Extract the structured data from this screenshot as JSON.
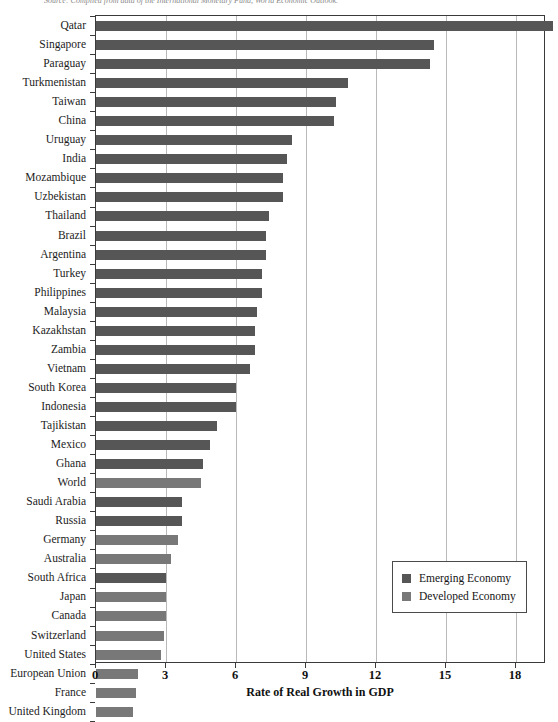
{
  "source_note": "Source: Compiled from data of the International Monetary Fund, World Economic Outlook.",
  "legend": {
    "items": [
      {
        "label": "Emerging Economy",
        "color": "#565656",
        "key": "emerging"
      },
      {
        "label": "Developed Economy",
        "color": "#787878",
        "key": "developed"
      }
    ]
  },
  "axis": {
    "x_title": "Rate of Real Growth in GDP",
    "x_ticks": [
      "0",
      "3",
      "6",
      "9",
      "12",
      "15",
      "18"
    ]
  },
  "chart_data": {
    "type": "bar",
    "orientation": "horizontal",
    "title": "",
    "xlabel": "Rate of Real Growth in GDP",
    "ylabel": "",
    "xlim": [
      0,
      19.9
    ],
    "xticks": [
      0,
      3,
      6,
      9,
      12,
      15,
      18
    ],
    "grid": true,
    "legend_position": "inside-bottom-right",
    "series_colors": {
      "emerging": "#565656",
      "developed": "#787878"
    },
    "categories": [
      "Qatar",
      "Singapore",
      "Paraguay",
      "Turkmenistan",
      "Taiwan",
      "China",
      "Uruguay",
      "India",
      "Mozambique",
      "Uzbekistan",
      "Thailand",
      "Brazil",
      "Argentina",
      "Turkey",
      "Philippines",
      "Malaysia",
      "Kazakhstan",
      "Zambia",
      "Vietnam",
      "South Korea",
      "Indonesia",
      "Tajikistan",
      "Mexico",
      "Ghana",
      "World",
      "Saudi Arabia",
      "Russia",
      "Germany",
      "Australia",
      "South Africa",
      "Japan",
      "Canada",
      "Switzerland",
      "United States",
      "European Union",
      "France",
      "United Kingdom"
    ],
    "values": [
      19.6,
      14.5,
      14.3,
      10.8,
      10.3,
      10.2,
      8.4,
      8.2,
      8.0,
      8.0,
      7.4,
      7.3,
      7.3,
      7.1,
      7.1,
      6.9,
      6.8,
      6.8,
      6.6,
      6.0,
      6.0,
      5.2,
      4.9,
      4.6,
      4.5,
      3.7,
      3.7,
      3.5,
      3.2,
      3.0,
      3.0,
      3.0,
      2.9,
      2.8,
      1.8,
      1.7,
      1.6
    ],
    "groups": [
      "emerging",
      "emerging",
      "emerging",
      "emerging",
      "emerging",
      "emerging",
      "emerging",
      "emerging",
      "emerging",
      "emerging",
      "emerging",
      "emerging",
      "emerging",
      "emerging",
      "emerging",
      "emerging",
      "emerging",
      "emerging",
      "emerging",
      "emerging",
      "emerging",
      "emerging",
      "emerging",
      "emerging",
      "developed",
      "emerging",
      "emerging",
      "developed",
      "developed",
      "emerging",
      "developed",
      "developed",
      "developed",
      "developed",
      "developed",
      "developed",
      "developed"
    ]
  }
}
